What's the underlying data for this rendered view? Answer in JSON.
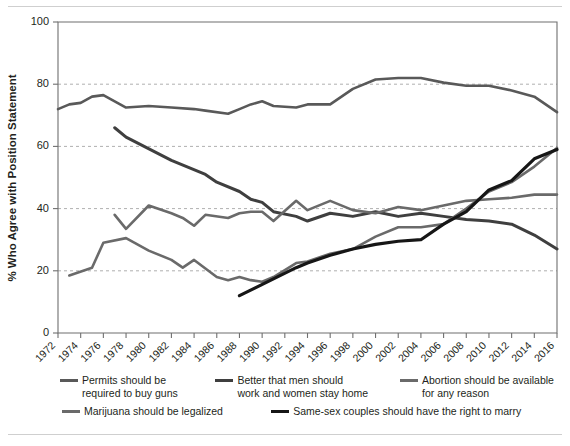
{
  "chart_data": {
    "type": "line",
    "title": "",
    "xlabel": "",
    "ylabel": "% Who Agree with Position Statement",
    "xlim": [
      1972,
      2016
    ],
    "ylim": [
      0,
      100
    ],
    "grid": true,
    "legend_position": "bottom",
    "xtick_labels": [
      "1972",
      "1974",
      "1976",
      "1978",
      "1980",
      "1982",
      "1984",
      "1986",
      "1988",
      "1990",
      "1992",
      "1994",
      "1996",
      "1998",
      "2000",
      "2002",
      "2004",
      "2006",
      "2008",
      "2010",
      "2012",
      "2014",
      "2016"
    ],
    "ytick_labels": [
      "0",
      "20",
      "40",
      "60",
      "80",
      "100"
    ],
    "ytick_values": [
      0,
      20,
      40,
      60,
      80,
      100
    ],
    "series": [
      {
        "name": "Permits should be required to buy guns",
        "color": "#595959",
        "width": 2.6,
        "x": [
          1972,
          1973,
          1974,
          1975,
          1976,
          1977,
          1978,
          1980,
          1982,
          1984,
          1985,
          1987,
          1988,
          1989,
          1990,
          1991,
          1993,
          1994,
          1996,
          1998,
          2000,
          2002,
          2004,
          2006,
          2008,
          2010,
          2012,
          2014,
          2016
        ],
        "y": [
          72.0,
          73.5,
          74.0,
          76.0,
          76.5,
          74.5,
          72.5,
          73.0,
          72.5,
          72.0,
          71.5,
          70.5,
          72.0,
          73.5,
          74.5,
          73.0,
          72.5,
          73.5,
          73.5,
          78.5,
          81.5,
          82.0,
          82.0,
          80.5,
          79.5,
          79.5,
          78.0,
          76.0,
          71.0
        ]
      },
      {
        "name": "Better that men should work and women stay home",
        "color": "#3f3f3f",
        "width": 3.0,
        "x": [
          1977,
          1978,
          1982,
          1985,
          1986,
          1988,
          1989,
          1990,
          1991,
          1993,
          1994,
          1996,
          1998,
          2000,
          2002,
          2004,
          2006,
          2008,
          2010,
          2012,
          2014,
          2016
        ],
        "y": [
          66.0,
          63.0,
          55.5,
          51.0,
          48.5,
          45.5,
          43.0,
          42.0,
          39.0,
          37.5,
          36.0,
          38.5,
          37.5,
          39.0,
          37.5,
          38.5,
          37.5,
          36.5,
          36.0,
          35.0,
          31.5,
          27.0
        ]
      },
      {
        "name": "Abortion should be available for any reason",
        "color": "#6a6a6a",
        "width": 2.6,
        "x": [
          1977,
          1978,
          1980,
          1982,
          1983,
          1984,
          1985,
          1987,
          1988,
          1989,
          1990,
          1991,
          1993,
          1994,
          1996,
          1998,
          2000,
          2002,
          2004,
          2006,
          2008,
          2010,
          2012,
          2014,
          2016
        ],
        "y": [
          38.0,
          33.5,
          41.0,
          38.5,
          37.0,
          34.5,
          38.0,
          37.0,
          38.5,
          39.0,
          39.0,
          36.0,
          42.5,
          39.5,
          42.5,
          39.5,
          38.5,
          40.5,
          39.5,
          41.0,
          42.5,
          43.0,
          43.5,
          44.5,
          44.5
        ]
      },
      {
        "name": "Marijuana should be legalized",
        "color": "#6a6a6a",
        "width": 2.6,
        "x": [
          1973,
          1975,
          1976,
          1978,
          1980,
          1982,
          1983,
          1984,
          1986,
          1987,
          1988,
          1989,
          1990,
          1991,
          1993,
          1994,
          1996,
          1998,
          2000,
          2002,
          2004,
          2006,
          2008,
          2010,
          2012,
          2014,
          2016
        ],
        "y": [
          18.5,
          21.0,
          29.0,
          30.5,
          26.5,
          23.5,
          21.0,
          23.5,
          18.0,
          17.0,
          18.0,
          17.0,
          16.5,
          18.0,
          22.5,
          23.0,
          25.5,
          27.0,
          31.0,
          34.0,
          34.0,
          35.0,
          40.0,
          45.5,
          48.5,
          53.5,
          59.5
        ]
      },
      {
        "name": "Same-sex couples should have the right to marry",
        "color": "#161616",
        "width": 3.2,
        "x": [
          1988,
          1993,
          1994,
          1996,
          1998,
          2000,
          2002,
          2004,
          2006,
          2008,
          2010,
          2012,
          2014,
          2016
        ],
        "y": [
          12.0,
          21.0,
          22.5,
          25.0,
          27.0,
          28.5,
          29.5,
          30.0,
          35.0,
          39.0,
          46.0,
          49.0,
          56.0,
          59.0
        ]
      }
    ]
  },
  "legend": {
    "items": [
      {
        "label": "Permits should be\nrequired to buy guns",
        "color": "#595959"
      },
      {
        "label": "Better that men should\nwork and women stay home",
        "color": "#3f3f3f"
      },
      {
        "label": "Abortion should be available\nfor any reason",
        "color": "#6a6a6a"
      },
      {
        "label": "Marijuana should be legalized",
        "color": "#6a6a6a"
      },
      {
        "label": "Same-sex couples should have the right to marry",
        "color": "#161616"
      }
    ]
  }
}
